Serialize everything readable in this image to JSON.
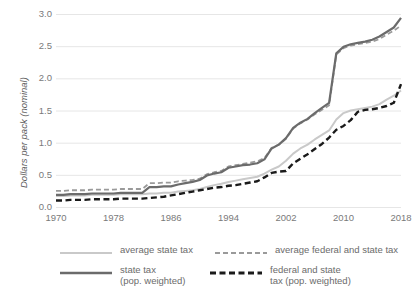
{
  "chart_data": {
    "type": "line",
    "title": "",
    "subtitle": "",
    "xlabel": "",
    "ylabel": "Dollars per pack (nominal)",
    "xlim": [
      1970,
      2018
    ],
    "ylim": [
      0.0,
      3.0
    ],
    "grid": "horizontal",
    "legend_position": "bottom",
    "xticks": [
      "1970",
      "1978",
      "1986",
      "1994",
      "2002",
      "2010",
      "2018"
    ],
    "xtick_values": [
      1970,
      1978,
      1986,
      1994,
      2002,
      2010,
      2018
    ],
    "yticks": [
      "0.0",
      "0.5",
      "1.0",
      "1.5",
      "2.0",
      "2.5",
      "3.0"
    ],
    "ytick_values": [
      0.0,
      0.5,
      1.0,
      1.5,
      2.0,
      2.5,
      3.0
    ],
    "x": [
      1970,
      1971,
      1972,
      1973,
      1974,
      1975,
      1976,
      1977,
      1978,
      1979,
      1980,
      1981,
      1982,
      1983,
      1984,
      1985,
      1986,
      1987,
      1988,
      1989,
      1990,
      1991,
      1992,
      1993,
      1994,
      1995,
      1996,
      1997,
      1998,
      1999,
      2000,
      2001,
      2002,
      2003,
      2004,
      2005,
      2006,
      2007,
      2008,
      2009,
      2010,
      2011,
      2012,
      2013,
      2014,
      2015,
      2016,
      2017,
      2018
    ],
    "series": [
      {
        "name": "average state tax",
        "color": "#c9c9c9",
        "style": "solid",
        "width": 2.0,
        "values": [
          0.17,
          0.17,
          0.18,
          0.18,
          0.18,
          0.19,
          0.19,
          0.19,
          0.19,
          0.2,
          0.2,
          0.2,
          0.2,
          0.21,
          0.21,
          0.22,
          0.22,
          0.24,
          0.25,
          0.26,
          0.28,
          0.31,
          0.34,
          0.36,
          0.39,
          0.41,
          0.43,
          0.45,
          0.47,
          0.52,
          0.58,
          0.63,
          0.72,
          0.83,
          0.91,
          0.97,
          1.05,
          1.12,
          1.19,
          1.36,
          1.46,
          1.5,
          1.52,
          1.54,
          1.56,
          1.6,
          1.67,
          1.73,
          1.81
        ]
      },
      {
        "name": "average federal and state tax",
        "color": "#9a9a9a",
        "style": "dashed",
        "width": 1.8,
        "values": [
          0.25,
          0.25,
          0.26,
          0.26,
          0.26,
          0.27,
          0.27,
          0.27,
          0.27,
          0.28,
          0.28,
          0.28,
          0.28,
          0.37,
          0.37,
          0.38,
          0.38,
          0.4,
          0.41,
          0.42,
          0.44,
          0.51,
          0.54,
          0.56,
          0.63,
          0.65,
          0.67,
          0.69,
          0.71,
          0.76,
          0.92,
          0.97,
          1.06,
          1.22,
          1.3,
          1.36,
          1.44,
          1.51,
          1.58,
          2.37,
          2.47,
          2.51,
          2.53,
          2.55,
          2.57,
          2.61,
          2.68,
          2.74,
          2.82
        ]
      },
      {
        "name": "state tax (pop. weighted)",
        "color": "#6b6b6b",
        "style": "solid",
        "width": 2.2,
        "values": [
          0.19,
          0.19,
          0.2,
          0.2,
          0.2,
          0.21,
          0.21,
          0.21,
          0.21,
          0.22,
          0.22,
          0.22,
          0.22,
          0.31,
          0.31,
          0.32,
          0.32,
          0.35,
          0.37,
          0.39,
          0.42,
          0.49,
          0.52,
          0.54,
          0.61,
          0.63,
          0.65,
          0.66,
          0.68,
          0.74,
          0.91,
          0.97,
          1.07,
          1.23,
          1.31,
          1.37,
          1.46,
          1.54,
          1.62,
          2.39,
          2.49,
          2.53,
          2.55,
          2.57,
          2.6,
          2.65,
          2.72,
          2.79,
          2.94
        ]
      },
      {
        "name": "federal and state tax (pop. weighted)",
        "color": "#1a1a1a",
        "style": "dashed-heavy",
        "width": 2.4,
        "values": [
          0.1,
          0.1,
          0.11,
          0.11,
          0.11,
          0.12,
          0.12,
          0.12,
          0.12,
          0.13,
          0.13,
          0.13,
          0.13,
          0.14,
          0.15,
          0.16,
          0.18,
          0.2,
          0.22,
          0.24,
          0.26,
          0.28,
          0.3,
          0.31,
          0.33,
          0.34,
          0.36,
          0.38,
          0.4,
          0.46,
          0.53,
          0.55,
          0.56,
          0.68,
          0.75,
          0.82,
          0.9,
          0.98,
          1.08,
          1.2,
          1.26,
          1.35,
          1.48,
          1.51,
          1.52,
          1.54,
          1.57,
          1.62,
          1.91
        ]
      }
    ]
  },
  "legend": {
    "items": [
      {
        "label": "average state tax",
        "sample": "solid-light"
      },
      {
        "label": "average federal and state tax",
        "sample": "dashed-mid"
      },
      {
        "label": "state tax\n(pop. weighted)",
        "sample": "solid-dark"
      },
      {
        "label": "federal and state\ntax (pop. weighted)",
        "sample": "dashed-dark"
      }
    ]
  },
  "colors": {
    "grid": "#e6e6e6",
    "tick_text": "#7a7a7a",
    "axis_title": "#5c5c5c",
    "background": "#ffffff"
  }
}
